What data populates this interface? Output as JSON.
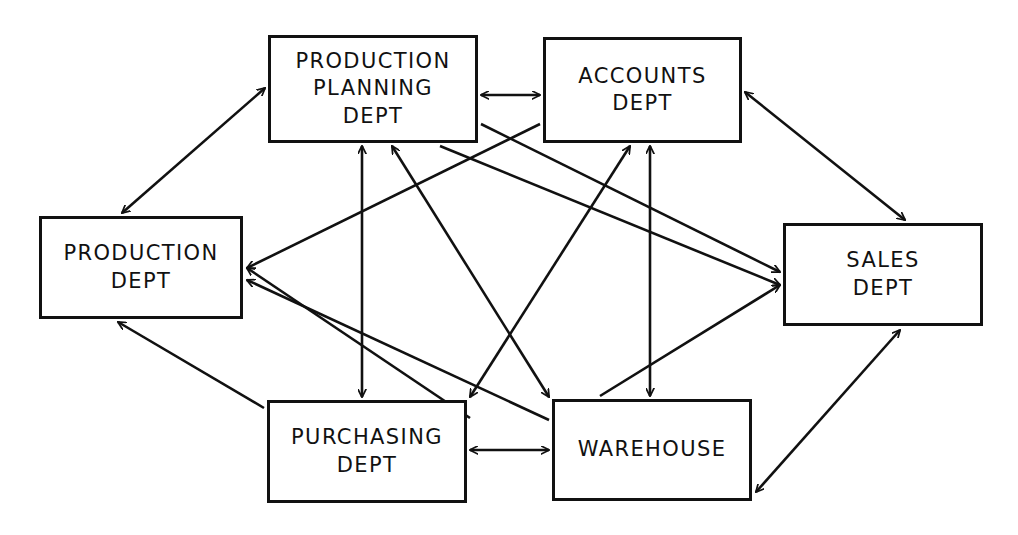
{
  "diagram": {
    "type": "block-diagram",
    "canvas": {
      "width": 1018,
      "height": 535
    },
    "style": {
      "line_color": "#111111",
      "box_fill": "#ffffff",
      "background": "#ffffff",
      "stroke_width": 3
    },
    "nodes": [
      {
        "id": "production-planning",
        "label": "PRODUCTION\nPLANNING\nDEPT",
        "x": 268,
        "y": 35,
        "w": 210,
        "h": 108
      },
      {
        "id": "accounts",
        "label": "ACCOUNTS\nDEPT",
        "x": 543,
        "y": 37,
        "w": 199,
        "h": 106
      },
      {
        "id": "production",
        "label": "PRODUCTION\nDEPT",
        "x": 39,
        "y": 216,
        "w": 204,
        "h": 103
      },
      {
        "id": "sales",
        "label": "SALES\nDEPT",
        "x": 783,
        "y": 223,
        "w": 200,
        "h": 103
      },
      {
        "id": "purchasing",
        "label": "PURCHASING\nDEPT",
        "x": 267,
        "y": 400,
        "w": 200,
        "h": 103
      },
      {
        "id": "warehouse",
        "label": "WAREHOUSE",
        "x": 552,
        "y": 399,
        "w": 200,
        "h": 102
      }
    ],
    "edges": [
      {
        "id": "e-pp-accounts",
        "from": "production-planning",
        "to": "accounts",
        "x1": 481,
        "y1": 95,
        "x2": 540,
        "y2": 95,
        "heads": "both"
      },
      {
        "id": "e-pp-production",
        "from": "production-planning",
        "to": "production",
        "x1": 265,
        "y1": 88,
        "x2": 122,
        "y2": 213,
        "heads": "both"
      },
      {
        "id": "e-accounts-sales",
        "from": "accounts",
        "to": "sales",
        "x1": 745,
        "y1": 92,
        "x2": 905,
        "y2": 220,
        "heads": "both"
      },
      {
        "id": "e-pp-purchasing",
        "from": "production-planning",
        "to": "purchasing",
        "x1": 362,
        "y1": 146,
        "x2": 362,
        "y2": 397,
        "heads": "both"
      },
      {
        "id": "e-accounts-warehouse",
        "from": "accounts",
        "to": "warehouse",
        "x1": 650,
        "y1": 146,
        "x2": 650,
        "y2": 396,
        "heads": "both"
      },
      {
        "id": "e-purchasing-production",
        "from": "purchasing",
        "to": "production",
        "x1": 264,
        "y1": 408,
        "x2": 118,
        "y2": 322,
        "heads": "end"
      },
      {
        "id": "e-warehouse-sales",
        "from": "warehouse",
        "to": "sales",
        "x1": 756,
        "y1": 492,
        "x2": 900,
        "y2": 330,
        "heads": "both"
      },
      {
        "id": "e-purchasing-warehouse",
        "from": "purchasing",
        "to": "warehouse",
        "x1": 470,
        "y1": 450,
        "x2": 549,
        "y2": 450,
        "heads": "both"
      },
      {
        "id": "e-purchasing-accounts",
        "from": "purchasing",
        "to": "accounts",
        "x1": 470,
        "y1": 397,
        "x2": 630,
        "y2": 146,
        "heads": "both"
      },
      {
        "id": "e-warehouse-pp",
        "from": "warehouse",
        "to": "production-planning",
        "x1": 549,
        "y1": 397,
        "x2": 392,
        "y2": 146,
        "heads": "both"
      },
      {
        "id": "e-warehouse-production",
        "from": "warehouse",
        "to": "production",
        "x1": 549,
        "y1": 420,
        "x2": 247,
        "y2": 280,
        "heads": "end"
      },
      {
        "id": "e-purchasing-prod2",
        "from": "purchasing",
        "to": "production",
        "x1": 470,
        "y1": 418,
        "x2": 247,
        "y2": 268,
        "heads": "end"
      },
      {
        "id": "e-pp-sales",
        "from": "production-planning",
        "to": "sales",
        "x1": 481,
        "y1": 124,
        "x2": 780,
        "y2": 272,
        "heads": "end"
      },
      {
        "id": "e-accounts-prod",
        "from": "accounts",
        "to": "production",
        "x1": 540,
        "y1": 124,
        "x2": 247,
        "y2": 268,
        "heads": "end"
      },
      {
        "id": "e-pp-sales2",
        "from": "production-planning",
        "to": "sales",
        "x1": 440,
        "y1": 146,
        "x2": 780,
        "y2": 285,
        "heads": "end"
      },
      {
        "id": "e-ware-sales2",
        "from": "warehouse",
        "to": "sales",
        "x1": 600,
        "y1": 396,
        "x2": 780,
        "y2": 285,
        "heads": "end"
      }
    ]
  }
}
